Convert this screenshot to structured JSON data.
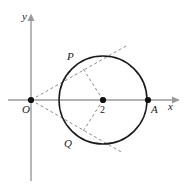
{
  "figure": {
    "type": "geometry-diagram",
    "canvas": {
      "width": 192,
      "height": 188,
      "background": "#ffffff"
    },
    "colors": {
      "axis": "#9a9a9a",
      "curve": "#1a1a1a",
      "dashed": "#8c8c8c",
      "point": "#111111",
      "label": "#1a1a1a"
    },
    "axes": {
      "x_label": "x",
      "y_label": "y",
      "x_axis": {
        "y": 100,
        "x_start": 8,
        "x_end": 180
      },
      "y_axis": {
        "x": 31,
        "y_start": 14,
        "y_end": 181
      }
    },
    "labels": {
      "origin": "O",
      "center_value": "2",
      "point_a": "A",
      "point_p": "P",
      "point_q": "Q",
      "x_axis": "x",
      "y_axis": "y"
    },
    "points": [
      {
        "name": "O",
        "label": "O",
        "x": 31,
        "y": 100,
        "marker": "filled-dot"
      },
      {
        "name": "C",
        "label": "2",
        "x": 103,
        "y": 100,
        "marker": "filled-dot"
      },
      {
        "name": "A",
        "label": "A",
        "x": 148,
        "y": 100,
        "marker": "filled-dot"
      },
      {
        "name": "P",
        "label": "P",
        "x": 82,
        "y": 67,
        "marker": "none"
      },
      {
        "name": "Q",
        "label": "Q",
        "x": 82,
        "y": 133,
        "marker": "none"
      }
    ],
    "circle": {
      "cx": 103,
      "cy": 100,
      "r": 44
    },
    "dashed_segments": [
      {
        "name": "tangent-OP",
        "x1": 31,
        "y1": 100,
        "x2": 126,
        "y2": 46
      },
      {
        "name": "tangent-OQ",
        "x1": 31,
        "y1": 100,
        "x2": 123,
        "y2": 153
      },
      {
        "name": "radius-CP",
        "x1": 103,
        "y1": 100,
        "x2": 82,
        "y2": 67
      },
      {
        "name": "radius-CQ",
        "x1": 103,
        "y1": 100,
        "x2": 82,
        "y2": 133
      }
    ],
    "label_positions": {
      "y": {
        "left": 22,
        "top": 11
      },
      "x": {
        "left": 168,
        "top": 102
      },
      "O": {
        "left": 22,
        "top": 104
      },
      "two": {
        "left": 99,
        "top": 104
      },
      "A": {
        "left": 150,
        "top": 104
      },
      "P": {
        "left": 67,
        "top": 51
      },
      "Q": {
        "left": 64,
        "top": 138
      }
    }
  }
}
